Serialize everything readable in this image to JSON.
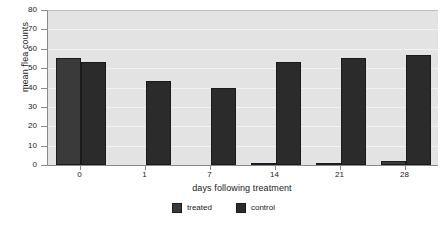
{
  "chart_data": {
    "type": "bar",
    "title": "",
    "xlabel": "days following treatment",
    "ylabel": "mean flea counts",
    "categories": [
      "0",
      "1",
      "7",
      "14",
      "21",
      "28"
    ],
    "series": [
      {
        "name": "treated",
        "color": "#3a3a3a",
        "values": [
          55,
          0,
          0,
          0.8,
          0.5,
          2.3
        ]
      },
      {
        "name": "control",
        "color": "#2b2b2b",
        "values": [
          53.3,
          43.6,
          40,
          53.4,
          55,
          57
        ]
      }
    ],
    "ylim": [
      0,
      80
    ],
    "yticks": [
      "0",
      "10",
      "20",
      "30",
      "40",
      "50",
      "60",
      "70",
      "80"
    ],
    "grid": true,
    "legend_position": "bottom",
    "legend": [
      "treated",
      "control"
    ],
    "plot_background": "#e3e3e3",
    "axis_color": "#8a8a8a"
  }
}
